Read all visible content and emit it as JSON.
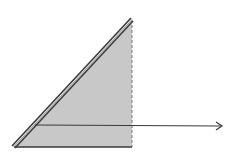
{
  "diagram": {
    "type": "geometry",
    "colors": {
      "background": "#ffffff",
      "fill": "#c8c8c8",
      "stroke": "#3a3a3a",
      "dashed": "#7a7a7a"
    },
    "triangle": {
      "apex": [
        132,
        19
      ],
      "bottom_left": [
        13,
        147
      ],
      "bottom_right": [
        132,
        147
      ]
    },
    "ray": {
      "start": [
        35,
        125
      ],
      "end": [
        222,
        126
      ]
    },
    "labels": []
  }
}
